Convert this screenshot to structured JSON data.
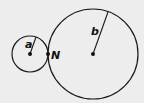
{
  "diagram": {
    "background": "#ededed",
    "stroke_color": "#1a1a1a",
    "circles": [
      {
        "id": "small",
        "cx": 30,
        "cy": 54,
        "r": 18,
        "radius_label": "a",
        "radius_end": [
          36,
          37
        ],
        "label_pos": [
          25,
          48
        ]
      },
      {
        "id": "large",
        "cx": 93,
        "cy": 54,
        "r": 45,
        "radius_label": "b",
        "radius_end": [
          108,
          12
        ],
        "label_pos": [
          91,
          35
        ]
      }
    ],
    "tangent_point": {
      "label": "N",
      "x": 48,
      "y": 54,
      "label_pos": [
        51,
        59
      ]
    }
  }
}
